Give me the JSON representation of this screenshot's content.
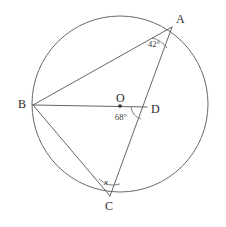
{
  "figure": {
    "type": "circle-geometry-diagram",
    "background_color": "#ffffff",
    "stroke_color": "#555555",
    "canvas": {
      "width": 226,
      "height": 227
    }
  },
  "circle": {
    "center_label": "O",
    "center": {
      "x": 120,
      "y": 104
    },
    "radius": 88
  },
  "points": {
    "A": {
      "label": "A",
      "x": 172,
      "y": 27
    },
    "B": {
      "label": "B",
      "x": 33,
      "y": 105
    },
    "C": {
      "label": "C",
      "x": 110,
      "y": 196
    },
    "D": {
      "label": "D",
      "x": 146,
      "y": 110
    },
    "O": {
      "label": "O",
      "x": 120,
      "y": 104
    }
  },
  "segments": [
    {
      "name": "BA",
      "from": "B",
      "to": "A"
    },
    {
      "name": "BD",
      "from": "B",
      "to": "D"
    },
    {
      "name": "BC",
      "from": "B",
      "to": "C"
    },
    {
      "name": "AC",
      "from": "A",
      "to": "C"
    }
  ],
  "angles": [
    {
      "name": "angle-at-A",
      "vertex": "A",
      "label": "42°",
      "value": 42,
      "unit": "degrees"
    },
    {
      "name": "angle-at-D",
      "vertex": "D",
      "label": "68°",
      "value": 68,
      "unit": "degrees"
    },
    {
      "name": "angle-at-C",
      "vertex": "C",
      "label": "x",
      "value": null,
      "unit": "unknown"
    }
  ],
  "labels": {
    "vertex_a": "A",
    "vertex_b": "B",
    "vertex_c": "C",
    "vertex_d": "D",
    "center_o": "O",
    "angle_a": "42°",
    "angle_d": "68°",
    "angle_c": "x"
  }
}
